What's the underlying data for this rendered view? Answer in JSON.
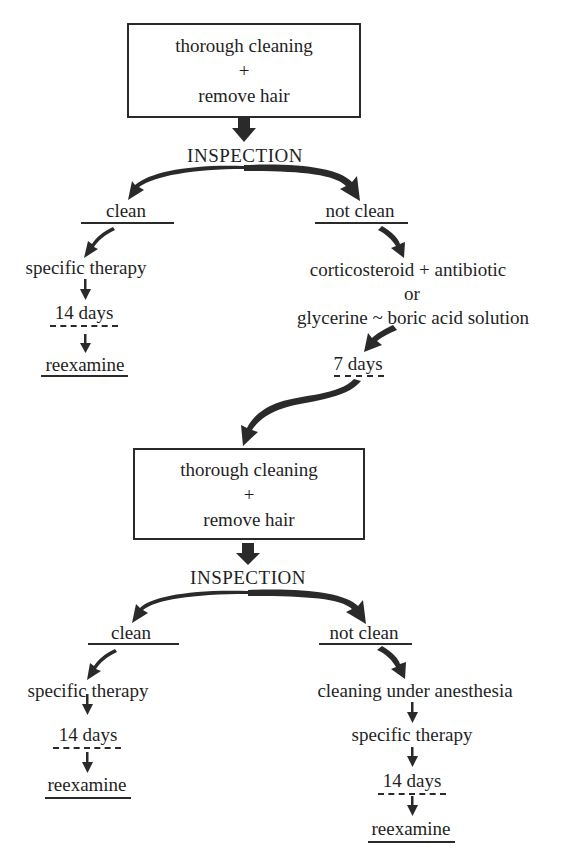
{
  "diagram": {
    "type": "treatment-flowchart",
    "ink_color": "#2a2a2a",
    "background": "#ffffff",
    "stage1": {
      "box": {
        "line1": "thorough cleaning",
        "line2": "+",
        "line3": "remove hair"
      },
      "inspection": "INSPECTION",
      "clean_branch": {
        "label": "clean",
        "step1": "specific therapy",
        "wait": "14 days",
        "end": "reexamine"
      },
      "not_clean_branch": {
        "label": "not clean",
        "treatment_line1": "corticosteroid + antibiotic",
        "treatment_or": "or",
        "treatment_line2": "glycerine ~ boric acid solution",
        "wait": "7 days"
      }
    },
    "stage2": {
      "box": {
        "line1": "thorough cleaning",
        "line2": "+",
        "line3": "remove hair"
      },
      "inspection": "INSPECTION",
      "clean_branch": {
        "label": "clean",
        "step1": "specific therapy",
        "wait": "14 days",
        "end": "reexamine"
      },
      "not_clean_branch": {
        "label": "not clean",
        "step1": "cleaning under anesthesia",
        "step2": "specific therapy",
        "wait": "14 days",
        "end": "reexamine"
      }
    },
    "edges": [
      {
        "from": "box-1",
        "to": "inspection-1",
        "style": "thick-arrow"
      },
      {
        "from": "inspection-1",
        "to": "clean-1",
        "style": "curved-arrow"
      },
      {
        "from": "inspection-1",
        "to": "not-clean-1",
        "style": "curved-thick-arrow"
      },
      {
        "from": "clean-1",
        "to": "specific-therapy-1",
        "style": "curved-arrow"
      },
      {
        "from": "specific-therapy-1",
        "to": "14-days-1a",
        "style": "thin-arrow"
      },
      {
        "from": "14-days-1a",
        "to": "reexamine-1a",
        "style": "thin-arrow"
      },
      {
        "from": "not-clean-1",
        "to": "corticosteroid-antibiotic",
        "style": "thick-arrow"
      },
      {
        "from": "glycerine-boric-acid",
        "to": "7-days",
        "style": "thick-arrow"
      },
      {
        "from": "7-days",
        "to": "box-2",
        "style": "long-curved-thick-arrow"
      },
      {
        "from": "box-2",
        "to": "inspection-2",
        "style": "thick-arrow"
      },
      {
        "from": "inspection-2",
        "to": "clean-2",
        "style": "curved-arrow"
      },
      {
        "from": "inspection-2",
        "to": "not-clean-2",
        "style": "curved-thick-arrow"
      },
      {
        "from": "clean-2",
        "to": "specific-therapy-2a",
        "style": "curved-arrow"
      },
      {
        "from": "specific-therapy-2a",
        "to": "14-days-2a",
        "style": "thin-arrow"
      },
      {
        "from": "14-days-2a",
        "to": "reexamine-2a",
        "style": "thin-arrow"
      },
      {
        "from": "not-clean-2",
        "to": "cleaning-under-anesthesia",
        "style": "thick-arrow"
      },
      {
        "from": "cleaning-under-anesthesia",
        "to": "specific-therapy-2b",
        "style": "thin-arrow"
      },
      {
        "from": "specific-therapy-2b",
        "to": "14-days-2b",
        "style": "thin-arrow"
      },
      {
        "from": "14-days-2b",
        "to": "reexamine-2b",
        "style": "thin-arrow"
      }
    ]
  }
}
